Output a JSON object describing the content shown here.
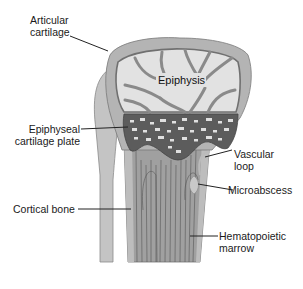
{
  "figure": {
    "labels": {
      "articular_cartilage": "Articular\ncartilage",
      "epiphysis": "Epiphysis",
      "epiphyseal_plate": "Epiphyseal\ncartilage plate",
      "vascular_loop": "Vascular\nloop",
      "microabscess": "Microabscess",
      "cortical_bone": "Cortical bone",
      "hematopoietic_marrow": "Hematopoietic\nmarrow"
    },
    "colors": {
      "cartilage": "#b4b4b4",
      "epiphysis_space": "#e4e4e4",
      "trabeculae": "#8a8a8a",
      "growth_plate": "#5a5a5a",
      "shaft": "#9e9e9e",
      "cortex": "#c2c2c2",
      "fibula": "#c4c4c4",
      "lines": "#333333"
    }
  }
}
